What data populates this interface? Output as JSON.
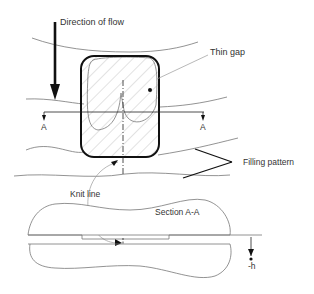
{
  "diagram": {
    "labels": {
      "direction_of_flow": "Direction of flow",
      "thin_gap": "Thin gap",
      "section_marker_left": "A",
      "section_marker_right": "A",
      "filling_pattern": "Filling pattern",
      "knit_line": "Knit line",
      "section_title": "Section A-A",
      "thickness": "-h"
    },
    "colors": {
      "outline": "#111111",
      "thin_line": "#777777",
      "hatch": "#999999",
      "text": "#333333"
    }
  }
}
